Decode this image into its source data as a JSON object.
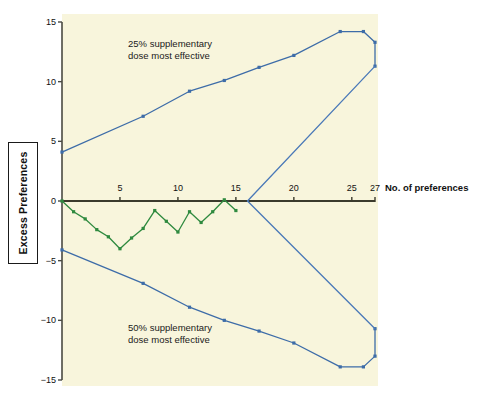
{
  "chart_data": {
    "type": "line",
    "title": "",
    "xlabel": "No. of preferences",
    "ylabel": "Excess Preferences",
    "xlim": [
      0,
      27
    ],
    "ylim": [
      -15,
      15
    ],
    "grid": false,
    "legend_position": "none",
    "x_ticks": [
      5,
      10,
      15,
      20,
      25,
      27
    ],
    "y_ticks": [
      15,
      10,
      5,
      0,
      -5,
      -10,
      -15
    ],
    "annotations": [
      {
        "name": "upper-annotation",
        "line1": "25% supplementary",
        "line2": "dose most effective"
      },
      {
        "name": "lower-annotation",
        "line1": "50% supplementary",
        "line2": "dose most effective"
      }
    ],
    "series": [
      {
        "name": "upper-boundary",
        "color": "#3d6ca8",
        "points": [
          {
            "x": 0,
            "y": 4.1
          },
          {
            "x": 7,
            "y": 7.1
          },
          {
            "x": 11,
            "y": 9.2
          },
          {
            "x": 14,
            "y": 10.1
          },
          {
            "x": 17,
            "y": 11.2
          },
          {
            "x": 20,
            "y": 12.2
          },
          {
            "x": 24,
            "y": 14.2
          },
          {
            "x": 26,
            "y": 14.2
          },
          {
            "x": 27,
            "y": 13.3
          },
          {
            "x": 27,
            "y": 11.3
          }
        ]
      },
      {
        "name": "lower-boundary",
        "color": "#3d6ca8",
        "points": [
          {
            "x": 0,
            "y": -4.1
          },
          {
            "x": 7,
            "y": -6.9
          },
          {
            "x": 11,
            "y": -8.9
          },
          {
            "x": 14,
            "y": -10.0
          },
          {
            "x": 17,
            "y": -10.9
          },
          {
            "x": 20,
            "y": -11.9
          },
          {
            "x": 24,
            "y": -13.9
          },
          {
            "x": 26,
            "y": -13.9
          },
          {
            "x": 27,
            "y": -13.0
          },
          {
            "x": 27,
            "y": -10.7
          }
        ]
      },
      {
        "name": "upper-convergence-ray",
        "color": "#4a79b8",
        "points": [
          {
            "x": 16,
            "y": 0
          },
          {
            "x": 27,
            "y": 11.3
          }
        ]
      },
      {
        "name": "lower-convergence-ray",
        "color": "#4a79b8",
        "points": [
          {
            "x": 16,
            "y": 0
          },
          {
            "x": 27,
            "y": -10.7
          }
        ]
      },
      {
        "name": "observed-excess-preferences",
        "color": "#2f8a3f",
        "points": [
          {
            "x": 0,
            "y": 0
          },
          {
            "x": 1,
            "y": -0.9
          },
          {
            "x": 2,
            "y": -1.5
          },
          {
            "x": 3,
            "y": -2.4
          },
          {
            "x": 4,
            "y": -3.0
          },
          {
            "x": 5,
            "y": -4.0
          },
          {
            "x": 6,
            "y": -3.1
          },
          {
            "x": 7,
            "y": -2.3
          },
          {
            "x": 8,
            "y": -0.8
          },
          {
            "x": 9,
            "y": -1.7
          },
          {
            "x": 10,
            "y": -2.6
          },
          {
            "x": 11,
            "y": -0.9
          },
          {
            "x": 12,
            "y": -1.8
          },
          {
            "x": 13,
            "y": -0.9
          },
          {
            "x": 14,
            "y": 0.1
          },
          {
            "x": 15,
            "y": -0.8
          }
        ]
      }
    ]
  }
}
